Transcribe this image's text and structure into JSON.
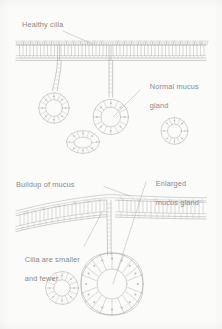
{
  "figure": {
    "title_visible": false,
    "background_color": "#fbfbfa",
    "ink_color": "#9a9a98",
    "label_color": "#8a8a88",
    "style": "pencil line drawing, histology cross-section"
  },
  "panels": [
    {
      "id": "healthy-airway",
      "state": "healthy",
      "labels": [
        {
          "name": "healthy-cilia-label",
          "text": "Healthy cilia",
          "x": 22,
          "y": 20
        },
        {
          "name": "normal-mucus-gland-label",
          "line1": "Normal mucus",
          "line2": "gland",
          "x": 141,
          "y": 73
        }
      ],
      "epithelium": {
        "cilia": "tall and dense",
        "mucus_layer": "thin"
      },
      "glands": [
        {
          "name": "gland-acinus-left",
          "size": "normal"
        },
        {
          "name": "gland-acinus-right",
          "size": "normal"
        },
        {
          "name": "gland-section-oval",
          "size": "normal"
        },
        {
          "name": "gland-section-small",
          "size": "normal"
        }
      ]
    },
    {
      "id": "diseased-airway",
      "state": "diseased",
      "labels": [
        {
          "name": "buildup-of-mucus-label",
          "text": "Buildup of mucus",
          "x": 16,
          "y": 180
        },
        {
          "name": "enlarged-mucus-gland-label",
          "line1": "Enlarged",
          "line2": "mucus gland",
          "x": 147,
          "y": 170
        },
        {
          "name": "cilia-smaller-fewer-label",
          "line1": "Cilia are smaller",
          "line2": "and fewer",
          "x": 16,
          "y": 246
        }
      ],
      "epithelium": {
        "cilia": "smaller and fewer",
        "mucus_layer": "thick buildup"
      },
      "glands": [
        {
          "name": "gland-section-small-diseased",
          "size": "normal"
        },
        {
          "name": "enlarged-gland-acinus",
          "size": "enlarged"
        }
      ]
    }
  ]
}
